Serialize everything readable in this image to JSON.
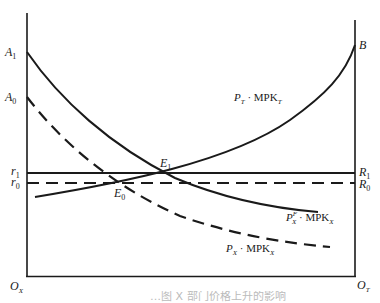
{
  "figure": {
    "type": "economics-diagram",
    "colors": {
      "line": "#1a1a1a",
      "background": "#ffffff"
    }
  },
  "axes": {
    "left_origin": {
      "main": "O",
      "sub": "X"
    },
    "right_origin": {
      "main": "O",
      "sub": "T"
    }
  },
  "left_axis_labels": {
    "A1": {
      "main": "A",
      "sub": "1"
    },
    "A0": {
      "main": "A",
      "sub": "0"
    },
    "r1": {
      "main": "r",
      "sub": "1"
    },
    "r0": {
      "main": "r",
      "sub": "0"
    }
  },
  "right_axis_labels": {
    "B": {
      "main": "B"
    },
    "R1": {
      "main": "R",
      "sub": "1"
    },
    "R0": {
      "main": "R",
      "sub": "0"
    }
  },
  "points": {
    "E1": {
      "main": "E",
      "sub": "1"
    },
    "E0": {
      "main": "E",
      "sub": "0"
    }
  },
  "curves": {
    "pt_mpkt": {
      "p": "P",
      "p_sub": "T",
      "dot": " · ",
      "mpk": "MPK",
      "mpk_sub": "T",
      "style": "solid"
    },
    "pxf_mpkx": {
      "p": "P",
      "p_sup": "F",
      "p_sub": "X",
      "dot": " · ",
      "mpk": "MPK",
      "mpk_sub": "X",
      "style": "solid"
    },
    "px_mpkx": {
      "p": "P",
      "p_sub": "X",
      "dot": " · ",
      "mpk": "MPK",
      "mpk_sub": "X",
      "style": "dashed"
    },
    "r1_line": {
      "style": "solid"
    },
    "r0_line": {
      "style": "dashed"
    }
  },
  "caption": {
    "text": "…图 X 部门价格上升的影响"
  }
}
